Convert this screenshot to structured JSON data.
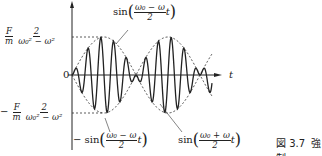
{
  "figure": {
    "caption_number": "図 3.7",
    "caption_text": "強制"
  },
  "axes": {
    "x_label": "t",
    "origin_label": "0"
  },
  "labels": {
    "upper_amp": {
      "prefix": "",
      "f_num": "F",
      "f_den": "m",
      "num": "2",
      "den": "ω₀² − ω²"
    },
    "lower_amp": {
      "prefix": "−",
      "f_num": "F",
      "f_den": "m",
      "num": "2",
      "den": "ω₀² − ω²"
    },
    "env_upper": {
      "prefix": "sin",
      "num": "ω₀ − ω",
      "den": "2",
      "var": "t"
    },
    "env_lower": {
      "prefix": "− sin",
      "num": "ω₀ − ω",
      "den": "2",
      "var": "t"
    },
    "carrier": {
      "prefix": "sin",
      "num": "ω₀ + ω",
      "den": "2",
      "var": "t"
    }
  },
  "chart_data": {
    "type": "line",
    "title": "",
    "xlabel": "t",
    "ylabel": "",
    "series": [
      {
        "name": "x(t)",
        "style": "solid"
      },
      {
        "name": "sin((ω0−ω)/2 t)",
        "style": "dashed"
      },
      {
        "name": "−sin((ω0−ω)/2 t)",
        "style": "dashed"
      }
    ],
    "ylim_labels": [
      "−(F/m)·2/(ω0²−ω²)",
      "(F/m)·2/(ω0²−ω²)"
    ]
  }
}
